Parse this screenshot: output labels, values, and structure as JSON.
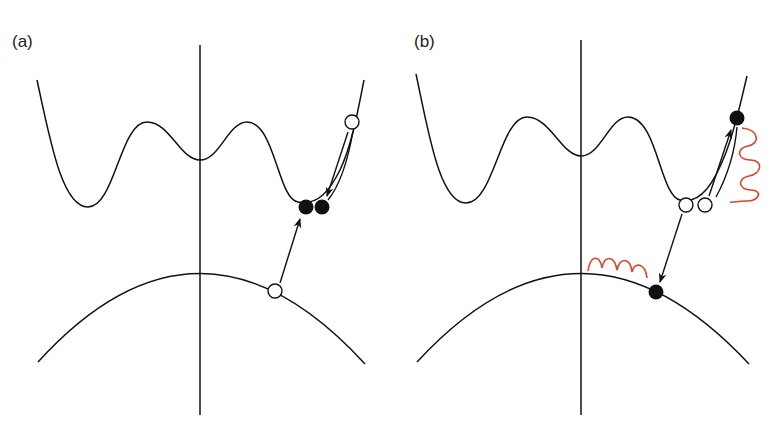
{
  "figure": {
    "panels": [
      {
        "id": "a",
        "label": "(a)",
        "description": "Photoexcitation from lower band to upper band with relaxation of two carriers into upper side valley",
        "carriers": [
          {
            "state": "hole",
            "style": "open",
            "location": "lower band"
          },
          {
            "state": "electron",
            "style": "filled",
            "location": "upper side valley"
          },
          {
            "state": "electron",
            "style": "filled",
            "location": "upper side valley"
          },
          {
            "state": "hole",
            "style": "open",
            "location": "upper band high energy"
          }
        ]
      },
      {
        "id": "b",
        "label": "(b)",
        "description": "Impact-ionization / Auger-like process with phonon emission shown as red wavy lines",
        "carriers": [
          {
            "state": "hole",
            "style": "open",
            "location": "upper side valley"
          },
          {
            "state": "hole",
            "style": "open",
            "location": "upper side valley"
          },
          {
            "state": "electron",
            "style": "filled",
            "location": "upper band high energy"
          },
          {
            "state": "electron",
            "style": "filled",
            "location": "lower band"
          }
        ],
        "emissions": [
          {
            "type": "phonon-wave",
            "location": "near upper right branch"
          },
          {
            "type": "phonon-wave",
            "location": "near lower band apex"
          }
        ]
      }
    ],
    "colors": {
      "line": "#111111",
      "wave": "#d8452a",
      "background": "#ffffff"
    }
  }
}
